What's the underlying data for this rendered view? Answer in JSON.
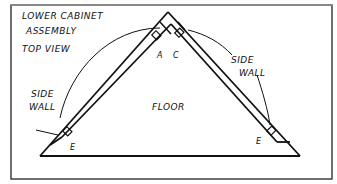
{
  "diagram": {
    "title_line1": "LOWER CABINET",
    "title_line2": "ASSEMBLY",
    "subtitle": "TOP VIEW",
    "label_side_wall_left_1": "SIDE",
    "label_side_wall_left_2": "WALL",
    "label_side_wall_right_1": "SIDE",
    "label_side_wall_right_2": "WALL",
    "label_floor": "FLOOR",
    "label_a": "A",
    "label_c": "C",
    "label_e_left": "E",
    "label_e_right": "E"
  }
}
